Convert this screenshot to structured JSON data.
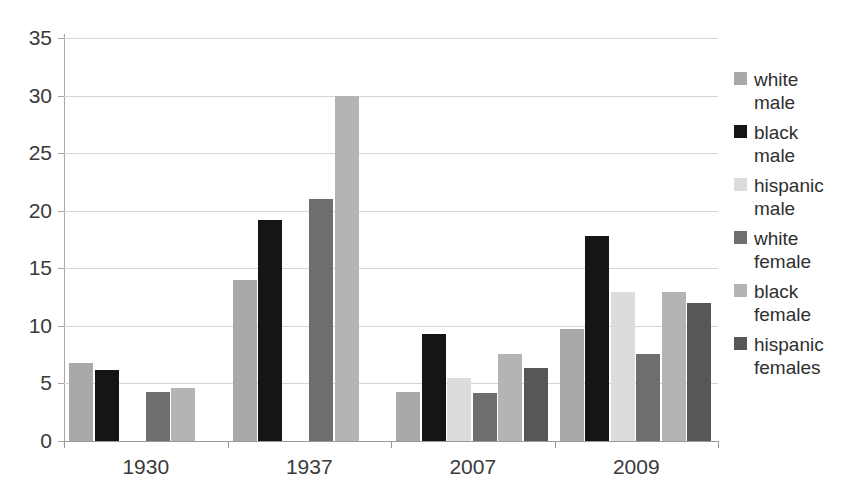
{
  "chart_data": {
    "type": "bar",
    "title": "",
    "xlabel": "",
    "ylabel": "",
    "categories": [
      "1930",
      "1937",
      "2007",
      "2009"
    ],
    "ylim": [
      0,
      35
    ],
    "yticks": [
      0,
      5,
      10,
      15,
      20,
      25,
      30,
      35
    ],
    "ytick_labels": [
      "0",
      "5",
      "10",
      "15",
      "20",
      "25",
      "30",
      "35"
    ],
    "grid": true,
    "legend_position": "right",
    "series": [
      {
        "name": "white\nmale",
        "color": "#a9a9a9",
        "values": [
          6.8,
          14.0,
          4.3,
          9.7
        ]
      },
      {
        "name": "black\nmale",
        "color": "#151515",
        "values": [
          6.2,
          19.2,
          9.3,
          17.8
        ]
      },
      {
        "name": "hispanic\nmale",
        "color": "#dcdcdc",
        "values": [
          null,
          null,
          5.5,
          12.9
        ]
      },
      {
        "name": "white\nfemale",
        "color": "#6e6e6e",
        "values": [
          4.3,
          21.0,
          4.2,
          7.6
        ]
      },
      {
        "name": "black\nfemale",
        "color": "#b4b4b4",
        "values": [
          4.6,
          30.0,
          7.6,
          12.9
        ]
      },
      {
        "name": "hispanic\nfemales",
        "color": "#575757",
        "values": [
          null,
          null,
          6.3,
          12.0
        ]
      }
    ]
  },
  "legend": {
    "items": [
      {
        "label": "white\nmale",
        "color": "#a9a9a9"
      },
      {
        "label": "black\nmale",
        "color": "#151515"
      },
      {
        "label": "hispanic\nmale",
        "color": "#dcdcdc"
      },
      {
        "label": "white\nfemale",
        "color": "#6e6e6e"
      },
      {
        "label": "black\nfemale",
        "color": "#b4b4b4"
      },
      {
        "label": "hispanic\nfemales",
        "color": "#575757"
      }
    ]
  }
}
